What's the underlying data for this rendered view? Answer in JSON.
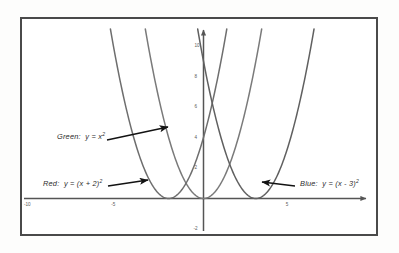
{
  "figure": {
    "background": "#fdfdfc",
    "frame_color": "#4a4a4a",
    "axis_color": "#555555"
  },
  "chart_data": {
    "type": "line",
    "title": "",
    "xlabel": "",
    "ylabel": "",
    "xlim": [
      -10.4,
      9.4
    ],
    "ylim": [
      -2.4,
      11.6
    ],
    "grid": false,
    "legend": "annotations",
    "x_ticks": [
      -10,
      -5,
      5
    ],
    "x_tick_labels": [
      "-10",
      "-5",
      "5"
    ],
    "y_ticks": [
      2,
      4,
      6,
      8,
      10
    ],
    "y_tick_labels": [
      "2",
      "4",
      "6",
      "8",
      "10"
    ],
    "series": [
      {
        "name": "Green",
        "equation": "y = x^2",
        "color": "#7a7a7a",
        "vertex": [
          0,
          0
        ],
        "a": 1,
        "h": 0,
        "k": 0,
        "x": [
          -3.4,
          -3.0,
          -2.5,
          -2.0,
          -1.5,
          -1.0,
          -0.5,
          0,
          0.5,
          1.0,
          1.5,
          2.0,
          2.5,
          3.0,
          3.4
        ],
        "y": [
          11.56,
          9.0,
          6.25,
          4.0,
          2.25,
          1.0,
          0.25,
          0,
          0.25,
          1.0,
          2.25,
          4.0,
          6.25,
          9.0,
          11.56
        ]
      },
      {
        "name": "Red",
        "equation": "y = (x + 2)^2",
        "color": "#6e6e6e",
        "vertex": [
          -2,
          0
        ],
        "a": 1,
        "h": -2,
        "k": 0,
        "x": [
          -5.4,
          -5.0,
          -4.5,
          -4.0,
          -3.5,
          -3.0,
          -2.5,
          -2.0,
          -1.5,
          -1.0,
          -0.5,
          0,
          0.5,
          1.0,
          1.4
        ],
        "y": [
          11.56,
          9.0,
          6.25,
          4.0,
          2.25,
          1.0,
          0.25,
          0,
          0.25,
          1.0,
          2.25,
          4.0,
          6.25,
          9.0,
          11.56
        ]
      },
      {
        "name": "Blue",
        "equation": "y = (x - 3)^2",
        "color": "#606060",
        "vertex": [
          3,
          0
        ],
        "a": 1,
        "h": 3,
        "k": 0,
        "x": [
          -0.4,
          0,
          0.5,
          1.0,
          1.5,
          2.0,
          2.5,
          3.0,
          3.5,
          4.0,
          4.5,
          5.0,
          5.5,
          6.0,
          6.4
        ],
        "y": [
          11.56,
          9.0,
          6.25,
          4.0,
          2.25,
          1.0,
          0.25,
          0,
          0.25,
          1.0,
          2.25,
          4.0,
          6.25,
          9.0,
          11.56
        ]
      }
    ],
    "annotations": [
      {
        "id": "green",
        "name": "Green",
        "separator": ":",
        "expr_lhs": "y",
        "expr_eq": "=",
        "expr_base": "x",
        "expr_exp": "2",
        "full_text": "Green: y = x2",
        "label_x": 57,
        "label_y": 131,
        "arrow_from": [
          107,
          140
        ],
        "arrow_to": [
          168,
          127
        ]
      },
      {
        "id": "red",
        "name": "Red",
        "separator": ":",
        "expr_lhs": "y",
        "expr_eq": "=",
        "expr_base": "(x + 2)",
        "expr_exp": "2",
        "full_text": "Red: y = (x + 2)2",
        "label_x": 43,
        "label_y": 178,
        "arrow_from": [
          108,
          186
        ],
        "arrow_to": [
          148,
          180
        ]
      },
      {
        "id": "blue",
        "name": "Blue",
        "separator": ":",
        "expr_lhs": "y",
        "expr_eq": "=",
        "expr_base": "(x - 3)",
        "expr_exp": "2",
        "full_text": "Blue: y = (x - 3)2",
        "label_x": 300,
        "label_y": 178,
        "arrow_from": [
          295,
          186
        ],
        "arrow_to": [
          262,
          182
        ]
      }
    ]
  }
}
